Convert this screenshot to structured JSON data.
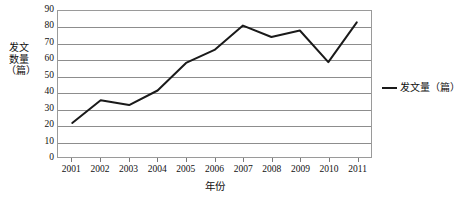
{
  "chart_data": {
    "type": "line",
    "title": "",
    "xlabel": "年份",
    "ylabel": "发文数量（篇）",
    "categories": [
      "2001",
      "2002",
      "2003",
      "2004",
      "2005",
      "2006",
      "2007",
      "2008",
      "2009",
      "2010",
      "2011"
    ],
    "series": [
      {
        "name": "发文量（篇）",
        "values": [
          21,
          35,
          32,
          41,
          58,
          66,
          81,
          74,
          78,
          58.5,
          83
        ]
      }
    ],
    "ylim": [
      0,
      90
    ],
    "ytick_labels": [
      "0",
      "10",
      "20",
      "30",
      "40",
      "50",
      "60",
      "70",
      "80",
      "90"
    ],
    "ytick_values": [
      0,
      10,
      20,
      30,
      40,
      50,
      60,
      70,
      80,
      90
    ],
    "grid": true,
    "grid_axis": "y",
    "legend_position": "right",
    "line_color": "#1a1a1a",
    "grid_color": "#8d8d8d",
    "frame_color": "#9a9a9a",
    "background_color": "#ffffff"
  },
  "legend": {
    "entries": [
      {
        "label": "发文量（篇）",
        "color": "#1a1a1a"
      }
    ]
  },
  "axes": {
    "y_title": "发文数量（篇）",
    "x_title": "年份"
  }
}
